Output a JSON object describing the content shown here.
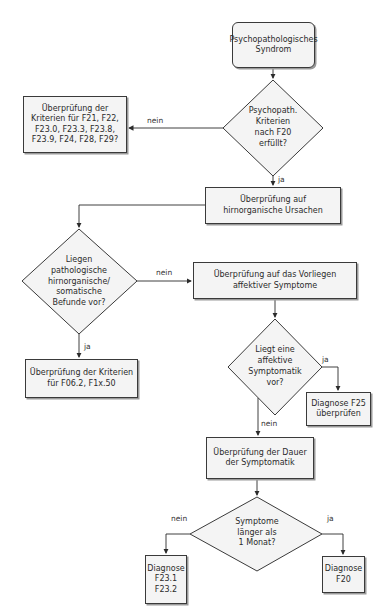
{
  "diagram": {
    "type": "flowchart",
    "colors": {
      "box_fill": "#f4f4f4",
      "stroke": "#3a3a3a",
      "shadow": "#9a9a9a",
      "text": "#2b2b2b"
    },
    "nodes": {
      "start": {
        "shape": "rounded-rect",
        "lines": [
          "Psychopathologisches",
          "Syndrom"
        ]
      },
      "d1": {
        "shape": "diamond",
        "lines": [
          "Psychopath.",
          "Kriterien",
          "nach F20",
          "erfüllt?"
        ]
      },
      "check_other": {
        "shape": "rect",
        "lines": [
          "Überprüfung der",
          "Kriterien für F21, F22,",
          "F23.0, F23.3, F23.8,",
          "F23.9, F24, F28, F29?"
        ]
      },
      "organic": {
        "shape": "rect",
        "lines": [
          "Überprüfung auf",
          "hirnorganische Ursachen"
        ]
      },
      "d2": {
        "shape": "diamond",
        "lines": [
          "Liegen",
          "pathologische",
          "hirnorganische/",
          "somatische",
          "Befunde vor?"
        ]
      },
      "affective": {
        "shape": "rect",
        "lines": [
          "Überprüfung auf das Vorliegen",
          "affektiver Symptome"
        ]
      },
      "f06": {
        "shape": "rect",
        "lines": [
          "Überprüfung der Kriterien",
          "für F06.2, F1x.50"
        ]
      },
      "d3": {
        "shape": "diamond",
        "lines": [
          "Liegt eine",
          "affektive",
          "Symptomatik",
          "vor?"
        ]
      },
      "f25": {
        "shape": "rect",
        "lines": [
          "Diagnose F25",
          "überprüfen"
        ]
      },
      "duration": {
        "shape": "rect",
        "lines": [
          "Überprüfung der Dauer",
          "der Symptomatik"
        ]
      },
      "d4": {
        "shape": "diamond",
        "lines": [
          "Symptome",
          "länger als",
          "1 Monat?"
        ]
      },
      "f23": {
        "shape": "rect",
        "lines": [
          "Diagnose",
          "F23.1",
          "F23.2"
        ]
      },
      "f20": {
        "shape": "rect",
        "lines": [
          "Diagnose",
          "F20"
        ]
      }
    },
    "edge_labels": {
      "d1_no": "nein",
      "d1_yes": "ja",
      "d2_no": "nein",
      "d2_yes": "ja",
      "d3_yes": "ja",
      "d3_no": "nein",
      "d4_no": "nein",
      "d4_yes": "ja"
    }
  }
}
